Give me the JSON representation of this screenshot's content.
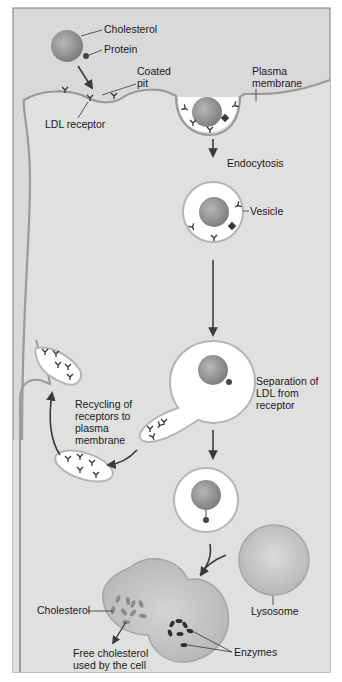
{
  "diagram": {
    "colors": {
      "frame_bg": "#d9d9d9",
      "cell_bg": "#dedede",
      "membrane": "#9a9a9a",
      "vesicle_fill": "#ffffff",
      "ldl_ball": "#8f8f8f",
      "lysosome": "#c4c4c4",
      "text": "#1a1a1a"
    },
    "labels": {
      "cholesterol_top": "Cholesterol",
      "protein": "Protein",
      "coated_pit_1": "Coated",
      "coated_pit_2": "pit",
      "plasma_membrane_1": "Plasma",
      "plasma_membrane_2": "membrane",
      "ldl_receptor": "LDL receptor",
      "endocytosis": "Endocytosis",
      "vesicle": "Vesicle",
      "separation_1": "Separation of",
      "separation_2": "LDL from",
      "separation_3": "receptor",
      "recycling_1": "Recycling of",
      "recycling_2": "receptors to",
      "recycling_3": "plasma",
      "recycling_4": "membrane",
      "lysosome": "Lysosome",
      "cholesterol_bottom": "Cholesterol",
      "enzymes": "Enzymes",
      "free_cholesterol_1": "Free cholesterol",
      "free_cholesterol_2": "used by the cell"
    },
    "steps": [
      "LDL binds LDL receptor in coated pit",
      "Endocytosis",
      "Vesicle",
      "Separation of LDL from receptor",
      "Recycling of receptors to plasma membrane",
      "Fusion with lysosome",
      "Free cholesterol used by the cell"
    ]
  }
}
